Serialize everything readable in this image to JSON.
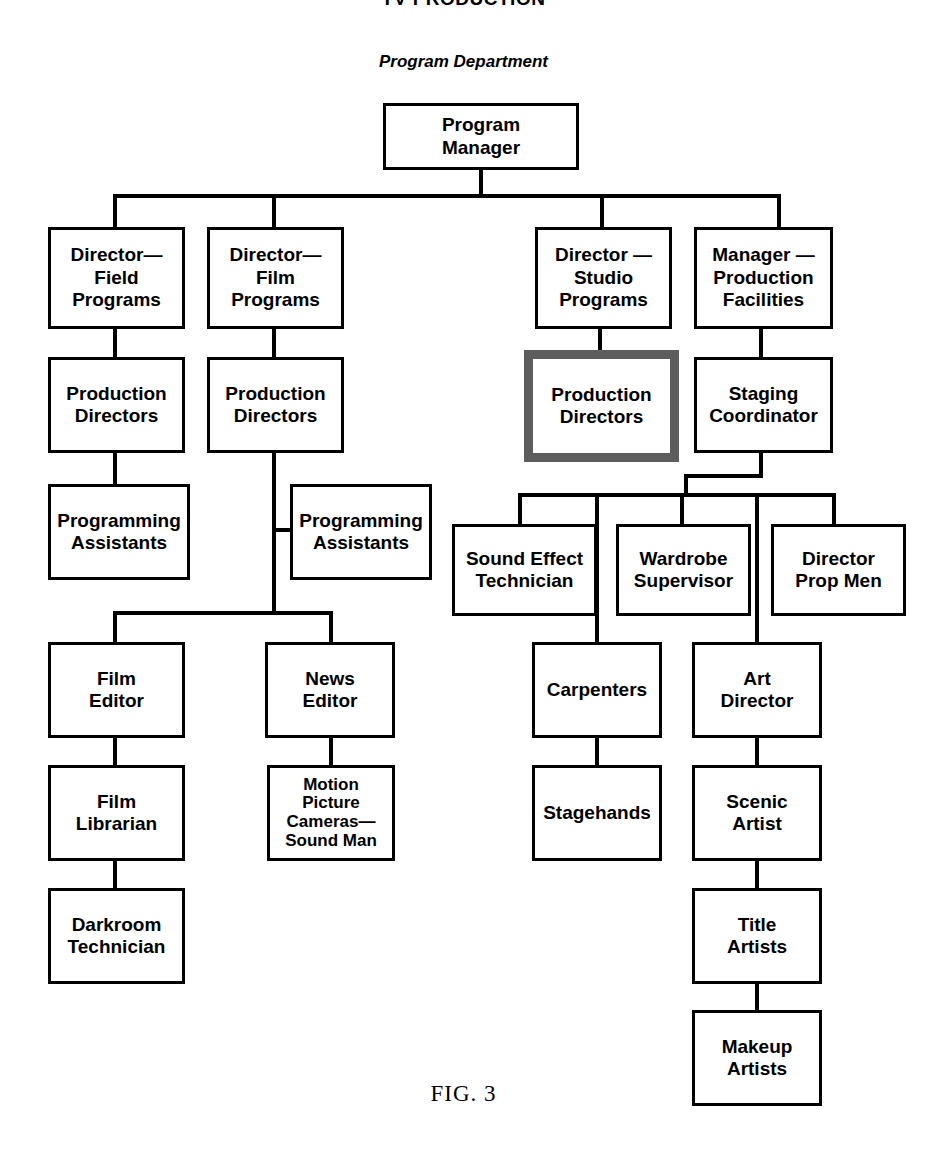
{
  "document": {
    "top_heading": "TV PRODUCTION",
    "sub_heading": "Program Department",
    "figure_caption": "FIG. 3"
  },
  "colors": {
    "line": "#000000",
    "box_border": "#000000",
    "highlight_border": "#5d5d5d",
    "background": "#ffffff"
  },
  "chart_data": {
    "type": "diagram",
    "title": "Program Department",
    "nodes": [
      {
        "id": "program-manager",
        "label": "Program\nManager",
        "x": 383,
        "y": 103,
        "w": 196,
        "h": 67,
        "highlight": false
      },
      {
        "id": "director-field",
        "label": "Director—\nField\nPrograms",
        "x": 48,
        "y": 227,
        "w": 137,
        "h": 102,
        "highlight": false
      },
      {
        "id": "director-film",
        "label": "Director—\nFilm\nPrograms",
        "x": 207,
        "y": 227,
        "w": 137,
        "h": 102,
        "highlight": false
      },
      {
        "id": "director-studio",
        "label": "Director —\nStudio\nPrograms",
        "x": 535,
        "y": 227,
        "w": 137,
        "h": 102,
        "highlight": false
      },
      {
        "id": "manager-production",
        "label": "Manager —\nProduction\nFacilities",
        "x": 694,
        "y": 227,
        "w": 139,
        "h": 102,
        "highlight": false
      },
      {
        "id": "production-directors-field",
        "label": "Production\nDirectors",
        "x": 48,
        "y": 357,
        "w": 137,
        "h": 96,
        "highlight": false
      },
      {
        "id": "production-directors-film",
        "label": "Production\nDirectors",
        "x": 207,
        "y": 357,
        "w": 137,
        "h": 96,
        "highlight": false
      },
      {
        "id": "production-directors-studio",
        "label": "Production\nDirectors",
        "x": 524,
        "y": 350,
        "w": 155,
        "h": 112,
        "highlight": true
      },
      {
        "id": "staging-coordinator",
        "label": "Staging\nCoordinator",
        "x": 694,
        "y": 357,
        "w": 139,
        "h": 96,
        "highlight": false
      },
      {
        "id": "programming-assistants-field",
        "label": "Programming\nAssistants",
        "x": 48,
        "y": 484,
        "w": 142,
        "h": 96,
        "highlight": false
      },
      {
        "id": "programming-assistants-film",
        "label": "Programming\nAssistants",
        "x": 290,
        "y": 484,
        "w": 142,
        "h": 96,
        "highlight": false
      },
      {
        "id": "sound-effect-technician",
        "label": "Sound Effect\nTechnician",
        "x": 452,
        "y": 524,
        "w": 145,
        "h": 92,
        "highlight": false
      },
      {
        "id": "wardrobe-supervisor",
        "label": "Wardrobe\nSupervisor",
        "x": 616,
        "y": 524,
        "w": 135,
        "h": 92,
        "highlight": false
      },
      {
        "id": "director-prop-men",
        "label": "Director\nProp Men",
        "x": 771,
        "y": 524,
        "w": 135,
        "h": 92,
        "highlight": false
      },
      {
        "id": "film-editor",
        "label": "Film\nEditor",
        "x": 48,
        "y": 642,
        "w": 137,
        "h": 96,
        "highlight": false
      },
      {
        "id": "news-editor",
        "label": "News\nEditor",
        "x": 265,
        "y": 642,
        "w": 130,
        "h": 96,
        "highlight": false
      },
      {
        "id": "carpenters",
        "label": "Carpenters",
        "x": 532,
        "y": 642,
        "w": 130,
        "h": 96,
        "highlight": false
      },
      {
        "id": "art-director",
        "label": "Art\nDirector",
        "x": 692,
        "y": 642,
        "w": 130,
        "h": 96,
        "highlight": false
      },
      {
        "id": "film-librarian",
        "label": "Film\nLibrarian",
        "x": 48,
        "y": 765,
        "w": 137,
        "h": 96,
        "highlight": false
      },
      {
        "id": "motion-picture-cameras",
        "label": "Motion\nPicture\nCameras—\nSound Man",
        "x": 267,
        "y": 765,
        "w": 128,
        "h": 96,
        "highlight": false
      },
      {
        "id": "stagehands",
        "label": "Stagehands",
        "x": 532,
        "y": 765,
        "w": 130,
        "h": 96,
        "highlight": false
      },
      {
        "id": "scenic-artist",
        "label": "Scenic\nArtist",
        "x": 692,
        "y": 765,
        "w": 130,
        "h": 96,
        "highlight": false
      },
      {
        "id": "darkroom-technician",
        "label": "Darkroom\nTechnician",
        "x": 48,
        "y": 888,
        "w": 137,
        "h": 96,
        "highlight": false
      },
      {
        "id": "title-artists",
        "label": "Title\nArtists",
        "x": 692,
        "y": 888,
        "w": 130,
        "h": 96,
        "highlight": false
      },
      {
        "id": "makeup-artists",
        "label": "Makeup\nArtists",
        "x": 692,
        "y": 1010,
        "w": 130,
        "h": 96,
        "highlight": false
      }
    ],
    "edges": [
      {
        "from": "program-manager",
        "to": "director-field"
      },
      {
        "from": "program-manager",
        "to": "director-film"
      },
      {
        "from": "program-manager",
        "to": "director-studio"
      },
      {
        "from": "program-manager",
        "to": "manager-production"
      },
      {
        "from": "director-field",
        "to": "production-directors-field"
      },
      {
        "from": "director-film",
        "to": "production-directors-film"
      },
      {
        "from": "director-studio",
        "to": "production-directors-studio"
      },
      {
        "from": "manager-production",
        "to": "staging-coordinator"
      },
      {
        "from": "production-directors-field",
        "to": "programming-assistants-field"
      },
      {
        "from": "production-directors-film",
        "to": "programming-assistants-film"
      },
      {
        "from": "production-directors-film",
        "to": "film-editor"
      },
      {
        "from": "production-directors-film",
        "to": "news-editor"
      },
      {
        "from": "staging-coordinator",
        "to": "sound-effect-technician"
      },
      {
        "from": "staging-coordinator",
        "to": "wardrobe-supervisor"
      },
      {
        "from": "staging-coordinator",
        "to": "director-prop-men"
      },
      {
        "from": "staging-coordinator",
        "to": "carpenters"
      },
      {
        "from": "staging-coordinator",
        "to": "art-director"
      },
      {
        "from": "film-editor",
        "to": "film-librarian"
      },
      {
        "from": "news-editor",
        "to": "motion-picture-cameras"
      },
      {
        "from": "carpenters",
        "to": "stagehands"
      },
      {
        "from": "art-director",
        "to": "scenic-artist"
      },
      {
        "from": "film-librarian",
        "to": "darkroom-technician"
      },
      {
        "from": "scenic-artist",
        "to": "title-artists"
      },
      {
        "from": "title-artists",
        "to": "makeup-artists"
      }
    ]
  },
  "lines": [
    {
      "id": "pm-stem",
      "x": 479,
      "y": 170,
      "w": 4,
      "h": 27
    },
    {
      "id": "row2-bus",
      "x": 113,
      "y": 194,
      "w": 668,
      "h": 4
    },
    {
      "id": "drop-director-field",
      "x": 113,
      "y": 194,
      "w": 4,
      "h": 35
    },
    {
      "id": "drop-director-film",
      "x": 272,
      "y": 194,
      "w": 4,
      "h": 35
    },
    {
      "id": "drop-director-studio",
      "x": 600,
      "y": 194,
      "w": 4,
      "h": 35
    },
    {
      "id": "drop-manager-prod",
      "x": 777,
      "y": 194,
      "w": 4,
      "h": 35
    },
    {
      "id": "df-to-pd",
      "x": 113,
      "y": 327,
      "w": 4,
      "h": 32
    },
    {
      "id": "dfilm-to-pd",
      "x": 272,
      "y": 327,
      "w": 4,
      "h": 32
    },
    {
      "id": "dstudio-to-pd",
      "x": 598,
      "y": 327,
      "w": 4,
      "h": 25
    },
    {
      "id": "mp-to-staging",
      "x": 759,
      "y": 327,
      "w": 4,
      "h": 32
    },
    {
      "id": "pdfield-to-pa",
      "x": 113,
      "y": 451,
      "w": 4,
      "h": 35
    },
    {
      "id": "pdfilm-trunk",
      "x": 272,
      "y": 451,
      "w": 4,
      "h": 163
    },
    {
      "id": "pa-film-stub",
      "x": 272,
      "y": 528,
      "w": 20,
      "h": 4
    },
    {
      "id": "editors-bus",
      "x": 113,
      "y": 611,
      "w": 220,
      "h": 4
    },
    {
      "id": "drop-film-editor",
      "x": 113,
      "y": 611,
      "w": 4,
      "h": 33
    },
    {
      "id": "drop-news-editor",
      "x": 329,
      "y": 611,
      "w": 4,
      "h": 33
    },
    {
      "id": "staging-stem",
      "x": 759,
      "y": 451,
      "w": 4,
      "h": 26
    },
    {
      "id": "staging-jog",
      "x": 684,
      "y": 474,
      "w": 79,
      "h": 4
    },
    {
      "id": "staging-jog-down",
      "x": 684,
      "y": 474,
      "w": 4,
      "h": 22
    },
    {
      "id": "staging-bus",
      "x": 518,
      "y": 493,
      "w": 318,
      "h": 4
    },
    {
      "id": "drop-sound-effect",
      "x": 518,
      "y": 493,
      "w": 4,
      "h": 34
    },
    {
      "id": "drop-wardrobe",
      "x": 680,
      "y": 493,
      "w": 4,
      "h": 34
    },
    {
      "id": "drop-prop-men",
      "x": 832,
      "y": 493,
      "w": 4,
      "h": 34
    },
    {
      "id": "drop-carpenters-col",
      "x": 595,
      "y": 493,
      "w": 4,
      "h": 152
    },
    {
      "id": "drop-art-dir-col",
      "x": 755,
      "y": 493,
      "w": 4,
      "h": 152
    },
    {
      "id": "film-ed-to-lib",
      "x": 113,
      "y": 736,
      "w": 4,
      "h": 32
    },
    {
      "id": "news-ed-to-mpc",
      "x": 329,
      "y": 736,
      "w": 4,
      "h": 32
    },
    {
      "id": "carp-to-stage",
      "x": 595,
      "y": 736,
      "w": 4,
      "h": 32
    },
    {
      "id": "art-to-scenic",
      "x": 755,
      "y": 736,
      "w": 4,
      "h": 32
    },
    {
      "id": "lib-to-dark",
      "x": 113,
      "y": 859,
      "w": 4,
      "h": 32
    },
    {
      "id": "scenic-to-title",
      "x": 755,
      "y": 859,
      "w": 4,
      "h": 32
    },
    {
      "id": "title-to-makeup",
      "x": 755,
      "y": 982,
      "w": 4,
      "h": 31
    }
  ]
}
